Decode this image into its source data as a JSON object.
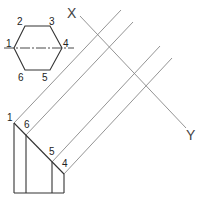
{
  "diagram": {
    "type": "orthographic auxiliary projection of hexagonal prism",
    "reference_line": {
      "start_label": "X",
      "end_label": "Y"
    },
    "plan_view": {
      "shape": "hexagon",
      "vertex_labels": [
        "1",
        "2",
        "3",
        "4",
        "5",
        "6"
      ]
    },
    "elevation_view": {
      "vertex_labels": [
        "1",
        "6",
        "5",
        "4"
      ]
    },
    "colors": {
      "line": "#333333",
      "projector": "#888888",
      "background": "#ffffff"
    }
  }
}
